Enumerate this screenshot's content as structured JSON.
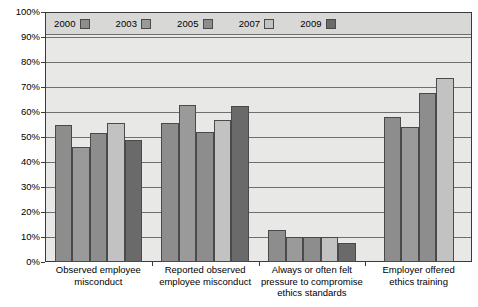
{
  "chart_data": {
    "type": "bar",
    "title": "",
    "subtitle": "",
    "xlabel": "",
    "ylabel": "",
    "ylim": [
      0,
      100
    ],
    "ytick_labels": [
      "100%",
      "90%",
      "80%",
      "70%",
      "60%",
      "50%",
      "40%",
      "30%",
      "20%",
      "10%",
      "0%"
    ],
    "ytick_values": [
      100,
      90,
      80,
      70,
      60,
      50,
      40,
      30,
      20,
      10,
      0
    ],
    "grid": true,
    "legend_position": "top-inside",
    "categories": [
      "Observed employee misconduct",
      "Reported observed employee misconduct",
      "Always or often felt pressure to compromise ethics standards",
      "Employer offered ethics training"
    ],
    "category_lines": [
      [
        "Observed employee",
        "misconduct"
      ],
      [
        "Reported observed",
        "employee misconduct"
      ],
      [
        "Always or often felt",
        "pressure to compromise",
        "ethics standards"
      ],
      [
        "Employer offered",
        "ethics training"
      ]
    ],
    "series": [
      {
        "name": "2000",
        "color": "#8d8d8d",
        "values": [
          55,
          55.5,
          13,
          58
        ]
      },
      {
        "name": "2003",
        "color": "#9a9a9a",
        "values": [
          46,
          63,
          10,
          54
        ]
      },
      {
        "name": "2005",
        "color": "#8d8d8d",
        "values": [
          51.5,
          52,
          10,
          67.5
        ]
      },
      {
        "name": "2007",
        "color": "#c2c2c2",
        "values": [
          55.5,
          57,
          10,
          73.5
        ]
      },
      {
        "name": "2009",
        "color": "#6a6a6a",
        "values": [
          49,
          62.5,
          7.5,
          null
        ]
      }
    ]
  },
  "legend": {
    "items": [
      {
        "label": "2000",
        "color": "#8d8d8d"
      },
      {
        "label": "2003",
        "color": "#9a9a9a"
      },
      {
        "label": "2005",
        "color": "#8d8d8d"
      },
      {
        "label": "2007",
        "color": "#c2c2c2"
      },
      {
        "label": "2009",
        "color": "#6a6a6a"
      }
    ]
  },
  "colors": {
    "plot_background": "#e8e8e6",
    "legend_background": "#d8d8d6",
    "gridline": "#6f6f6f",
    "axis": "#3a3a3a",
    "text": "#000000"
  }
}
